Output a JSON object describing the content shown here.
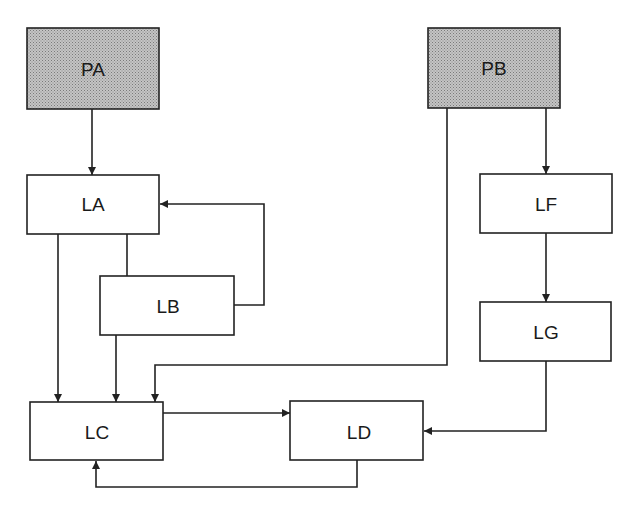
{
  "diagram": {
    "nodes": [
      {
        "id": "PA",
        "label": "PA",
        "shaded": true
      },
      {
        "id": "PB",
        "label": "PB",
        "shaded": true
      },
      {
        "id": "LA",
        "label": "LA",
        "shaded": false
      },
      {
        "id": "LB",
        "label": "LB",
        "shaded": false
      },
      {
        "id": "LC",
        "label": "LC",
        "shaded": false
      },
      {
        "id": "LD",
        "label": "LD",
        "shaded": false
      },
      {
        "id": "LF",
        "label": "LF",
        "shaded": false
      },
      {
        "id": "LG",
        "label": "LG",
        "shaded": false
      }
    ],
    "edges": [
      {
        "from": "PA",
        "to": "LA",
        "arrow": true
      },
      {
        "from": "LB",
        "to": "LA",
        "arrow": true
      },
      {
        "from": "LA",
        "to": "LB",
        "arrow": false
      },
      {
        "from": "LA",
        "to": "LC",
        "arrow": true
      },
      {
        "from": "LB",
        "to": "LC",
        "arrow": true
      },
      {
        "from": "PB",
        "to": "LC",
        "arrow": true
      },
      {
        "from": "PB",
        "to": "LF",
        "arrow": true
      },
      {
        "from": "LF",
        "to": "LG",
        "arrow": true
      },
      {
        "from": "LG",
        "to": "LD",
        "arrow": true
      },
      {
        "from": "LC",
        "to": "LD",
        "arrow": true
      },
      {
        "from": "LD",
        "to": "LC",
        "arrow": true
      }
    ],
    "colors": {
      "shaded_fill": "#b4b4b4",
      "stroke": "#222222",
      "box_fill": "#ffffff"
    }
  }
}
